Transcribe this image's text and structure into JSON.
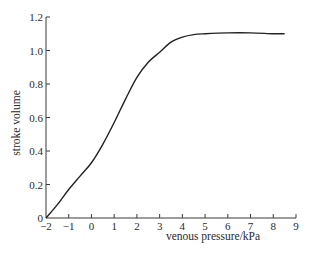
{
  "chart_data": {
    "type": "line",
    "title": "",
    "xlabel": "venous pressure/kPa",
    "ylabel": "stroke volume",
    "xlim": [
      -2,
      9
    ],
    "ylim": [
      0,
      1.2
    ],
    "x_ticks": [
      -2,
      -1,
      0,
      1,
      2,
      3,
      4,
      5,
      6,
      7,
      8,
      9
    ],
    "x_tick_labels": [
      "−2",
      "−1",
      "0",
      "1",
      "2",
      "3",
      "4",
      "5",
      "6",
      "7",
      "8",
      "9"
    ],
    "y_ticks": [
      0,
      0.2,
      0.4,
      0.6,
      0.8,
      1.0,
      1.2
    ],
    "y_tick_labels": [
      "0",
      "0.2",
      "0.4",
      "0.6",
      "0.8",
      "1.0",
      "1.2"
    ],
    "grid": false,
    "legend": null,
    "series": [
      {
        "name": "stroke volume",
        "color": "#222222",
        "x": [
          -2,
          -1.5,
          -1,
          -0.5,
          0,
          0.5,
          1,
          1.5,
          2,
          2.5,
          3,
          3.5,
          4,
          4.5,
          5,
          6,
          7,
          8,
          8.5
        ],
        "y": [
          0,
          0.08,
          0.17,
          0.25,
          0.33,
          0.44,
          0.57,
          0.71,
          0.84,
          0.93,
          0.99,
          1.05,
          1.08,
          1.095,
          1.1,
          1.105,
          1.105,
          1.1,
          1.1
        ]
      }
    ]
  }
}
